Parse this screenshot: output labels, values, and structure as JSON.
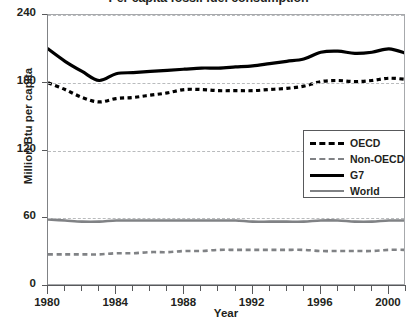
{
  "chart_data": {
    "type": "line",
    "title": "Per capita fossil fuel consumption",
    "xlabel": "Year",
    "ylabel": "Million Btu per capita",
    "xlim": [
      1980,
      2001
    ],
    "ylim": [
      0,
      240
    ],
    "yticks": [
      0,
      60,
      120,
      180,
      240
    ],
    "xticks": [
      1980,
      1984,
      1988,
      1992,
      1996,
      2000
    ],
    "xtick_labels": [
      "1980",
      "1984",
      "1988",
      "1992",
      "1996",
      "2000"
    ],
    "ytick_labels": [
      "0",
      "60",
      "120",
      "180",
      "240"
    ],
    "grid": "horizontal-dashed",
    "legend_position": "center-right",
    "x": [
      1980,
      1981,
      1982,
      1983,
      1984,
      1985,
      1986,
      1987,
      1988,
      1989,
      1990,
      1991,
      1992,
      1993,
      1994,
      1995,
      1996,
      1997,
      1998,
      1999,
      2000,
      2001
    ],
    "series": [
      {
        "name": "OECD",
        "style": "dashed",
        "color": "#000000",
        "width": 3.2,
        "values": [
          180,
          174,
          167,
          163,
          166,
          167,
          169,
          171,
          174,
          174,
          173,
          173,
          173,
          174,
          175,
          177,
          181,
          182,
          181,
          182,
          184,
          183
        ]
      },
      {
        "name": "Non-OECD",
        "style": "dashed",
        "color": "#808285",
        "width": 2.6,
        "values": [
          28,
          28,
          28,
          28,
          29,
          29,
          30,
          30,
          31,
          31,
          32,
          32,
          32,
          32,
          32,
          32,
          31,
          31,
          31,
          31,
          32,
          32
        ]
      },
      {
        "name": "G7",
        "style": "solid",
        "color": "#000000",
        "width": 3.2,
        "values": [
          210,
          199,
          190,
          182,
          188,
          189,
          190,
          191,
          192,
          193,
          193,
          194,
          195,
          197,
          199,
          201,
          207,
          208,
          206,
          207,
          210,
          206
        ]
      },
      {
        "name": "World",
        "style": "solid",
        "color": "#808285",
        "width": 2.6,
        "values": [
          59,
          58,
          57,
          57,
          58,
          58,
          58,
          58,
          58,
          58,
          58,
          58,
          57,
          57,
          57,
          57,
          58,
          58,
          57,
          57,
          58,
          58
        ]
      }
    ],
    "legend": [
      {
        "label": "OECD"
      },
      {
        "label": "Non-OECD"
      },
      {
        "label": "G7"
      },
      {
        "label": "World"
      }
    ]
  }
}
